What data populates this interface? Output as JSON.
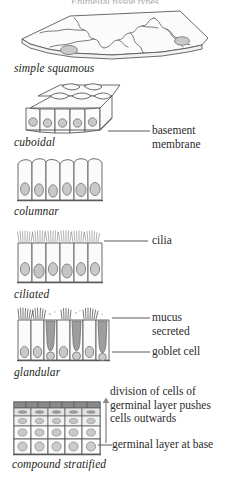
{
  "diagram": {
    "title": "Epithelial tissue types",
    "palette": {
      "outline": "#595959",
      "cell_fill": "#fafafa",
      "nucleus_fill": "#c9c9c9",
      "nucleus_stroke": "#8c8c8c",
      "goblet_fill": "#9e9e9e",
      "mucus": "#4a4a4a",
      "cilia": "#6e6e6e",
      "text": "#231f20",
      "leader": "#585858",
      "stratified_top": "#6b6b6b"
    },
    "tissues": [
      {
        "id": "simple-squamous",
        "label": "simple squamous",
        "nuclei": 2,
        "description": "flat sheet of thin cells shown in perspective"
      },
      {
        "id": "cuboidal",
        "label": "cuboidal",
        "cells_front": 5,
        "description": "three dimensional block of cube shaped cells"
      },
      {
        "id": "columnar",
        "label": "columnar",
        "cells": 6,
        "description": "row of tall narrow cells with basal nuclei"
      },
      {
        "id": "ciliated",
        "label": "ciliated",
        "cells": 6,
        "description": "columnar cells topped with cilia"
      },
      {
        "id": "glandular",
        "label": "glandular",
        "cells": 7,
        "goblet_cells": 3,
        "description": "columnar cells interspersed with goblet cells secreting mucus"
      },
      {
        "id": "compound-stratified",
        "label": "compound stratified",
        "layers": 5,
        "description": "several layers of cells, flattened at the surface"
      }
    ],
    "annotations": [
      {
        "id": "basement-membrane",
        "lines": [
          "basement",
          "membrane"
        ]
      },
      {
        "id": "cilia",
        "lines": [
          "cilia"
        ]
      },
      {
        "id": "mucus-secreted",
        "lines": [
          "mucus",
          "secreted"
        ]
      },
      {
        "id": "goblet-cell",
        "lines": [
          "goblet cell"
        ]
      },
      {
        "id": "division-note",
        "lines": [
          "division of cells of",
          "germinal layer pushes",
          "cells outwards"
        ]
      },
      {
        "id": "germinal-layer",
        "lines": [
          "germinal layer at base"
        ]
      }
    ]
  }
}
